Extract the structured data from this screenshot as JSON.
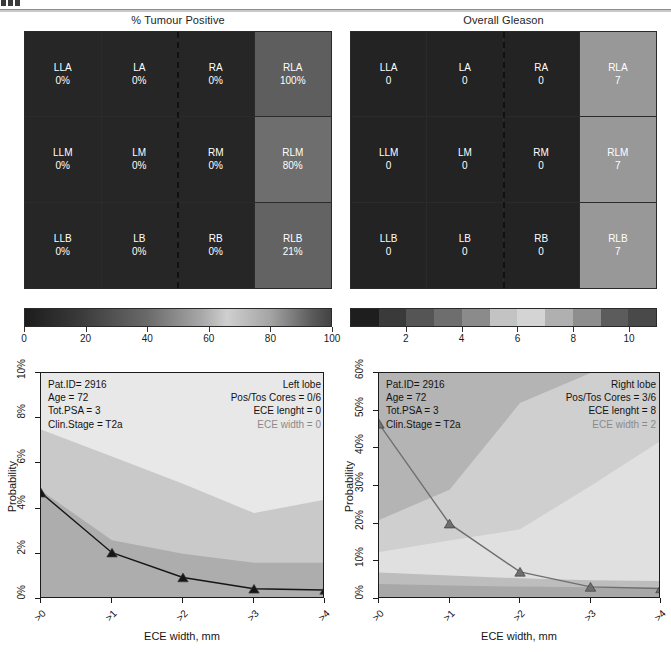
{
  "top_artifact": {
    "name": "cropped-page-marker"
  },
  "heatmaps": [
    {
      "title": "% Tumour Positive",
      "cells": [
        {
          "label": "LLA",
          "value": "0%",
          "shade": "#262626"
        },
        {
          "label": "LA",
          "value": "0%",
          "shade": "#262626"
        },
        {
          "label": "RA",
          "value": "0%",
          "shade": "#262626"
        },
        {
          "label": "RLA",
          "value": "100%",
          "shade": "#5e5e5e"
        },
        {
          "label": "LLM",
          "value": "0%",
          "shade": "#262626"
        },
        {
          "label": "LM",
          "value": "0%",
          "shade": "#262626"
        },
        {
          "label": "RM",
          "value": "0%",
          "shade": "#262626"
        },
        {
          "label": "RLM",
          "value": "80%",
          "shade": "#6e6e6e"
        },
        {
          "label": "LLB",
          "value": "0%",
          "shade": "#262626"
        },
        {
          "label": "LB",
          "value": "0%",
          "shade": "#262626"
        },
        {
          "label": "RB",
          "value": "0%",
          "shade": "#262626"
        },
        {
          "label": "RLB",
          "value": "21%",
          "shade": "#636363"
        }
      ],
      "colorbar": {
        "type": "continuous",
        "ticks": [
          0,
          20,
          40,
          60,
          80,
          100
        ],
        "tick_labels": [
          "0",
          "20",
          "40",
          "60",
          "80",
          "100"
        ],
        "min": 0,
        "max": 100
      }
    },
    {
      "title": "Overall Gleason",
      "cells": [
        {
          "label": "LLA",
          "value": "0",
          "shade": "#232323"
        },
        {
          "label": "LA",
          "value": "0",
          "shade": "#232323"
        },
        {
          "label": "RA",
          "value": "0",
          "shade": "#232323"
        },
        {
          "label": "RLA",
          "value": "7",
          "shade": "#989898"
        },
        {
          "label": "LLM",
          "value": "0",
          "shade": "#232323"
        },
        {
          "label": "LM",
          "value": "0",
          "shade": "#232323"
        },
        {
          "label": "RM",
          "value": "0",
          "shade": "#232323"
        },
        {
          "label": "RLM",
          "value": "7",
          "shade": "#989898"
        },
        {
          "label": "LLB",
          "value": "0",
          "shade": "#232323"
        },
        {
          "label": "LB",
          "value": "0",
          "shade": "#232323"
        },
        {
          "label": "RB",
          "value": "0",
          "shade": "#232323"
        },
        {
          "label": "RLB",
          "value": "7",
          "shade": "#989898"
        }
      ],
      "colorbar": {
        "type": "discrete",
        "bands": [
          "#1e1e1e",
          "#3a3a3a",
          "#555555",
          "#6e6e6e",
          "#8b8b8b",
          "#c3c3c3",
          "#d4d4d4",
          "#b0b0b0",
          "#8e8e8e",
          "#5c5c5c",
          "#494949"
        ],
        "ticks": [
          2,
          4,
          6,
          8,
          10
        ],
        "tick_labels": [
          "2",
          "4",
          "6",
          "8",
          "10"
        ],
        "min": 0,
        "max": 11
      }
    }
  ],
  "charts": [
    {
      "side": "left",
      "corner_label": "Right lobe",
      "info_left": [
        "Pat.ID= 2916",
        "Age = 72",
        "Tot.PSA = 3",
        "Clin.Stage = T2a"
      ],
      "info_right": [
        "Left lobe",
        "Pos/Tos Cores = 0/6",
        "ECE lenght = 0"
      ],
      "info_right_muted": "ECE width = 0",
      "ylabel": "Probability",
      "xlabel": "ECE width, mm",
      "yticks": [
        "0%",
        "2%",
        "4%",
        "6%",
        "8%",
        "10%"
      ],
      "xticks": [
        ">0",
        ">1",
        ">2",
        ">3",
        ">4"
      ]
    },
    {
      "side": "right",
      "corner_label": "Right lobe",
      "info_left": [
        "Pat.ID= 2916",
        "Age = 72",
        "Tot.PSA = 3",
        "Clin.Stage = T2a"
      ],
      "info_right": [
        "Right lobe",
        "Pos/Tos Cores = 3/6",
        "ECE lenght = 8"
      ],
      "info_right_muted": "ECE width = 2",
      "ylabel": "Probability",
      "xlabel": "ECE width, mm",
      "yticks": [
        "0%",
        "10%",
        "20%",
        "30%",
        "40%",
        "50%",
        "60%"
      ],
      "xticks": [
        ">0",
        ">1",
        ">2",
        ">3",
        ">4"
      ]
    }
  ],
  "chart_data": [
    {
      "type": "area",
      "title": "Left lobe ECE probability",
      "xlabel": "ECE width, mm",
      "ylabel": "Probability",
      "x": [
        ">0",
        ">1",
        ">2",
        ">3",
        ">4"
      ],
      "ylim": [
        0,
        10
      ],
      "yticks": [
        0,
        2,
        4,
        6,
        8,
        10
      ],
      "grid": false,
      "legend": "none",
      "series": [
        {
          "name": "upper band (light grey ceiling)",
          "values": [
            10.0,
            10.0,
            10.0,
            10.0,
            10.0
          ],
          "fill": "#e8e8e8"
        },
        {
          "name": "mid band upper bound",
          "values": [
            7.5,
            6.3,
            5.1,
            3.8,
            4.4
          ],
          "fill": "#c9c9c9"
        },
        {
          "name": "inner band upper bound",
          "values": [
            4.8,
            2.6,
            2.0,
            1.6,
            1.6
          ],
          "fill": "#adadad"
        },
        {
          "name": "predicted probability",
          "values": [
            4.7,
            2.05,
            0.95,
            0.45,
            0.4
          ],
          "marker": "triangle",
          "color": "#161616"
        }
      ]
    },
    {
      "type": "area",
      "title": "Right lobe ECE probability",
      "xlabel": "ECE width, mm",
      "ylabel": "Probability",
      "x": [
        ">0",
        ">1",
        ">2",
        ">3",
        ">4"
      ],
      "ylim": [
        0,
        60
      ],
      "yticks": [
        0,
        10,
        20,
        30,
        40,
        50,
        60
      ],
      "grid": false,
      "legend": "none",
      "series": [
        {
          "name": "outer dark band upper bound",
          "values": [
            60.0,
            60.0,
            60.0,
            60.0,
            60.0
          ],
          "fill": "#b4b4b4"
        },
        {
          "name": "dark band lower bound",
          "values": [
            21.0,
            29.0,
            52.0,
            60.0,
            60.0
          ],
          "fill": "#cfcfcf"
        },
        {
          "name": "light band lower bound",
          "values": [
            12.5,
            15.5,
            18.5,
            30.0,
            42.0
          ],
          "fill": "#e0e0e0"
        },
        {
          "name": "low band upper",
          "values": [
            7.0,
            6.2,
            5.5,
            5.0,
            4.8
          ],
          "fill": "#bdbdbd"
        },
        {
          "name": "lowest band upper",
          "values": [
            4.0,
            3.6,
            3.3,
            3.1,
            3.0
          ],
          "fill": "#a8a8a8"
        },
        {
          "name": "predicted probability",
          "values": [
            46.5,
            20.0,
            7.2,
            3.2,
            2.8
          ],
          "marker": "triangle",
          "color": "#6f6f6f"
        }
      ]
    }
  ]
}
